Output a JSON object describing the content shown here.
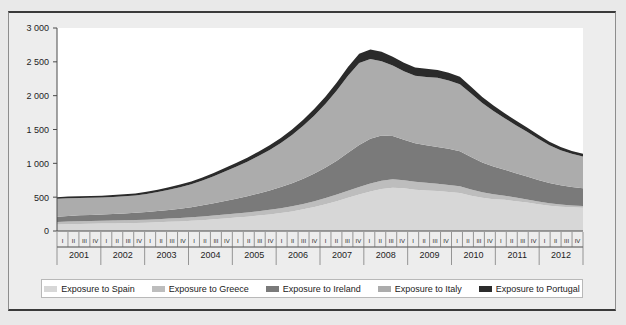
{
  "chart_data": {
    "type": "area",
    "stacked": true,
    "title": "",
    "xlabel": "",
    "ylabel": "",
    "ylim": [
      0,
      3000
    ],
    "yticks": [
      "0",
      "500",
      "1 000",
      "1 500",
      "2 000",
      "2 500",
      "3 000"
    ],
    "ytick_values": [
      0,
      500,
      1000,
      1500,
      2000,
      2500,
      3000
    ],
    "grid": false,
    "legend_position": "bottom",
    "years": [
      "2001",
      "2002",
      "2003",
      "2004",
      "2005",
      "2006",
      "2007",
      "2008",
      "2009",
      "2010",
      "2011",
      "2012"
    ],
    "quarters": [
      "I",
      "II",
      "III",
      "IV"
    ],
    "x": [
      "2001 I",
      "2001 II",
      "2001 III",
      "2001 IV",
      "2002 I",
      "2002 II",
      "2002 III",
      "2002 IV",
      "2003 I",
      "2003 II",
      "2003 III",
      "2003 IV",
      "2004 I",
      "2004 II",
      "2004 III",
      "2004 IV",
      "2005 I",
      "2005 II",
      "2005 III",
      "2005 IV",
      "2006 I",
      "2006 II",
      "2006 III",
      "2006 IV",
      "2007 I",
      "2007 II",
      "2007 III",
      "2007 IV",
      "2008 I",
      "2008 II",
      "2008 III",
      "2008 IV",
      "2009 I",
      "2009 II",
      "2009 III",
      "2009 IV",
      "2010 I",
      "2010 II",
      "2010 III",
      "2010 IV",
      "2011 I",
      "2011 II",
      "2011 III",
      "2011 IV",
      "2012 I",
      "2012 II",
      "2012 III",
      "2012 IV"
    ],
    "series": [
      {
        "name": "Exposure to Spain",
        "color": "#d7d7d7",
        "values": [
          95,
          100,
          105,
          108,
          110,
          112,
          115,
          118,
          122,
          128,
          135,
          142,
          150,
          160,
          172,
          185,
          198,
          212,
          228,
          245,
          265,
          290,
          320,
          355,
          395,
          440,
          490,
          540,
          585,
          620,
          640,
          630,
          610,
          600,
          590,
          575,
          560,
          520,
          490,
          470,
          460,
          440,
          420,
          395,
          375,
          360,
          350,
          345
        ]
      },
      {
        "name": "Exposure to Greece",
        "color": "#bdbdbd",
        "values": [
          38,
          40,
          40,
          41,
          42,
          43,
          44,
          45,
          46,
          47,
          48,
          50,
          52,
          54,
          56,
          58,
          60,
          62,
          65,
          68,
          72,
          76,
          80,
          85,
          92,
          98,
          105,
          112,
          118,
          122,
          124,
          120,
          116,
          112,
          108,
          104,
          100,
          92,
          82,
          72,
          62,
          54,
          46,
          40,
          34,
          30,
          28,
          26
        ]
      },
      {
        "name": "Exposure to Ireland",
        "color": "#7a7a7a",
        "values": [
          78,
          82,
          86,
          88,
          92,
          96,
          100,
          105,
          112,
          120,
          128,
          138,
          150,
          165,
          182,
          200,
          220,
          240,
          262,
          285,
          312,
          340,
          372,
          408,
          450,
          500,
          560,
          620,
          660,
          668,
          640,
          600,
          570,
          555,
          545,
          535,
          520,
          480,
          440,
          410,
          385,
          360,
          340,
          320,
          300,
          285,
          272,
          262
        ]
      },
      {
        "name": "Exposure to Italy",
        "color": "#acacac",
        "values": [
          265,
          262,
          258,
          255,
          250,
          252,
          255,
          258,
          268,
          282,
          298,
          318,
          340,
          368,
          400,
          435,
          472,
          510,
          552,
          598,
          650,
          712,
          782,
          860,
          945,
          1040,
          1140,
          1210,
          1180,
          1100,
          1040,
          1010,
          1000,
          1010,
          1020,
          1010,
          990,
          940,
          880,
          820,
          760,
          710,
          660,
          610,
          560,
          520,
          490,
          468
        ]
      },
      {
        "name": "Exposure to Portugal",
        "color": "#2b2b2b",
        "values": [
          24,
          25,
          26,
          26,
          27,
          28,
          29,
          30,
          32,
          34,
          36,
          38,
          41,
          44,
          48,
          52,
          56,
          60,
          65,
          70,
          76,
          82,
          89,
          97,
          106,
          116,
          127,
          136,
          140,
          138,
          132,
          126,
          122,
          120,
          118,
          114,
          110,
          100,
          90,
          82,
          74,
          68,
          62,
          56,
          50,
          46,
          43,
          41
        ]
      }
    ],
    "totals_note": "Stacked totals rise from ~500 in 2001 I to a peak of ~2 390 in 2008 I, dip and rebound to ~2 050 in 2009 II–III, then decline to ~1 140 by 2012 IV."
  },
  "legend": {
    "items": [
      {
        "label": "Exposure to Spain",
        "color": "#d7d7d7"
      },
      {
        "label": "Exposure to Greece",
        "color": "#bdbdbd"
      },
      {
        "label": "Exposure to Ireland",
        "color": "#7a7a7a"
      },
      {
        "label": "Exposure to Italy",
        "color": "#acacac"
      },
      {
        "label": "Exposure to Portugal",
        "color": "#2b2b2b"
      }
    ]
  },
  "colors": {
    "background": "#e9e9e9",
    "panel": "#ededed",
    "plot": "#ffffff",
    "axis": "#4a4a4a",
    "border": "#3a3a3a",
    "text": "#1e1e1e"
  }
}
